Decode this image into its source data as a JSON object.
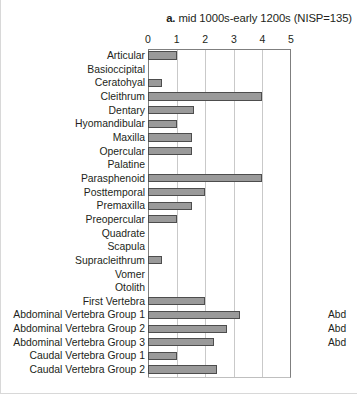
{
  "chart_data": {
    "type": "bar",
    "orientation": "horizontal",
    "title": "a. mid 1000s-early 1200s (NISP=135)",
    "title_prefix": "a.",
    "title_rest": " mid 1000s-early 1200s (NISP=135)",
    "xlabel": "",
    "ylabel": "",
    "xlim": [
      0,
      5
    ],
    "xticks": [
      0,
      1,
      2,
      3,
      4,
      5
    ],
    "xtick_labels": [
      "0",
      "1",
      "2",
      "3",
      "4",
      "5"
    ],
    "grid": true,
    "legend": "none",
    "bar_color": "#9a9a9a",
    "bar_edge_color": "#4d4d4d",
    "categories": [
      "Articular",
      "Basioccipital",
      "Ceratohyal",
      "Cleithrum",
      "Dentary",
      "Hyomandibular",
      "Maxilla",
      "Opercular",
      "Palatine",
      "Parasphenoid",
      "Posttemporal",
      "Premaxilla",
      "Preopercular",
      "Quadrate",
      "Scapula",
      "Supracleithrum",
      "Vomer",
      "Otolith",
      "First Vertebra",
      "Abdominal Vertebra Group 1",
      "Abdominal Vertebra Group 2",
      "Abdominal Vertebra Group 3",
      "Caudal Vertebra Group 1",
      "Caudal Vertebra Group 2"
    ],
    "values": [
      1.0,
      0,
      0.5,
      4.0,
      1.6,
      1.0,
      1.55,
      1.55,
      0,
      4.0,
      2.0,
      1.55,
      1.0,
      0,
      0,
      0.5,
      0,
      0,
      2.0,
      3.2,
      2.75,
      2.3,
      1.0,
      2.4
    ],
    "annotations": [
      {
        "category": "Abdominal Vertebra Group 1",
        "text": "Abd"
      },
      {
        "category": "Abdominal Vertebra Group 2",
        "text": "Abd"
      },
      {
        "category": "Abdominal Vertebra Group 3",
        "text": "Abd"
      }
    ]
  }
}
